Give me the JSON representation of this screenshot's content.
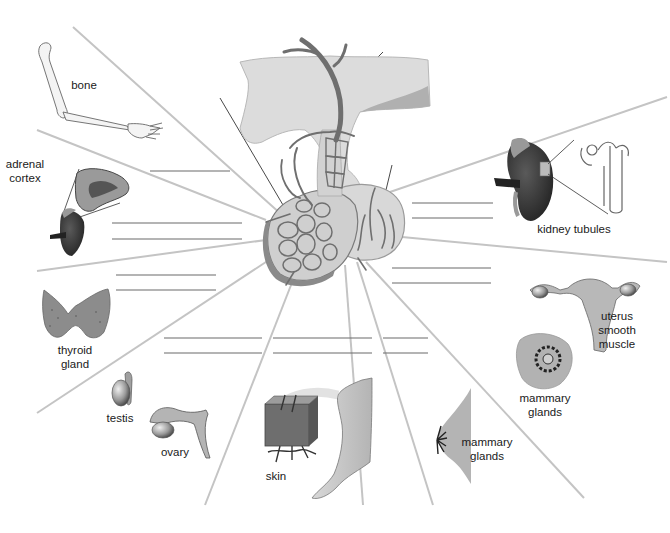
{
  "diagram": {
    "title": "",
    "center": "pituitary gland with hypothalamic blood vessels (anterior and posterior pituitary)",
    "targets": [
      {
        "id": "bone",
        "label": "bone"
      },
      {
        "id": "adrenal",
        "label_line1": "adrenal",
        "label_line2": "cortex"
      },
      {
        "id": "thyroid",
        "label_line1": "thyroid",
        "label_line2": "gland"
      },
      {
        "id": "testis",
        "label": "testis"
      },
      {
        "id": "ovary",
        "label": "ovary"
      },
      {
        "id": "skin",
        "label": "skin"
      },
      {
        "id": "mammary_bottom",
        "label_line1": "mammary",
        "label_line2": "glands"
      },
      {
        "id": "mammary_right",
        "label_line1": "mammary",
        "label_line2": "glands"
      },
      {
        "id": "uterus",
        "label_line1": "uterus",
        "label_line2": "smooth",
        "label_line3": "muscle"
      },
      {
        "id": "kidney",
        "label": "kidney tubules"
      }
    ],
    "blank_lines_count": 17,
    "colors": {
      "spoke": "#c4c4c4",
      "blank_line": "#6a6a6a",
      "vessel": "#6f6f6f",
      "tissue_light": "#dcdcdc",
      "tissue_mid": "#a8a8a8",
      "organ_dark": "#3d3d3d"
    }
  }
}
